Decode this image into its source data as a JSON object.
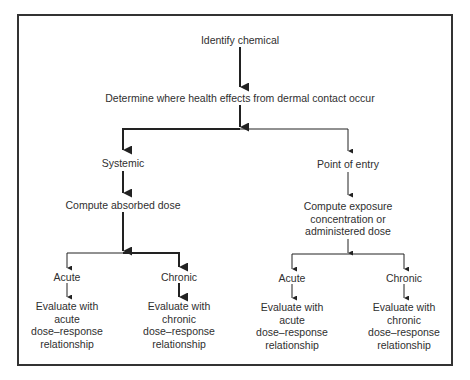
{
  "diagram": {
    "type": "flowchart",
    "nodes": {
      "identify": "Identify chemical",
      "determine": "Determine where health effects from dermal contact occur",
      "systemic": "Systemic",
      "absorbed": "Compute absorbed dose",
      "point_of_entry": "Point of entry",
      "exposure": [
        "Compute exposure",
        "concentration or",
        "administered dose"
      ],
      "left_acute": "Acute",
      "left_chronic": "Chronic",
      "left_acute_eval": [
        "Evaluate with",
        "acute",
        "dose–response",
        "relationship"
      ],
      "left_chronic_eval": [
        "Evaluate with",
        "chronic",
        "dose–response",
        "relationship"
      ],
      "right_acute": "Acute",
      "right_chronic": "Chronic",
      "right_acute_eval": [
        "Evaluate with",
        "acute",
        "dose–response",
        "relationship"
      ],
      "right_chronic_eval": [
        "Evaluate with",
        "chronic",
        "dose–response",
        "relationship"
      ]
    },
    "edges": [
      {
        "from": "identify",
        "to": "determine",
        "emphasis": "bold"
      },
      {
        "from": "determine",
        "to": "systemic",
        "emphasis": "bold"
      },
      {
        "from": "determine",
        "to": "point_of_entry",
        "emphasis": "thin"
      },
      {
        "from": "systemic",
        "to": "absorbed",
        "emphasis": "bold"
      },
      {
        "from": "absorbed",
        "to": "left_acute",
        "emphasis": "thin"
      },
      {
        "from": "absorbed",
        "to": "left_chronic",
        "emphasis": "bold"
      },
      {
        "from": "left_acute",
        "to": "left_acute_eval",
        "emphasis": "thin"
      },
      {
        "from": "left_chronic",
        "to": "left_chronic_eval",
        "emphasis": "bold"
      },
      {
        "from": "point_of_entry",
        "to": "exposure",
        "emphasis": "thin"
      },
      {
        "from": "exposure",
        "to": "right_acute",
        "emphasis": "thin"
      },
      {
        "from": "exposure",
        "to": "right_chronic",
        "emphasis": "thin"
      },
      {
        "from": "right_acute",
        "to": "right_acute_eval",
        "emphasis": "thin"
      },
      {
        "from": "right_chronic",
        "to": "right_chronic_eval",
        "emphasis": "thin"
      }
    ],
    "colors": {
      "line": "#222222",
      "text": "#2f2f2f",
      "frame": "#333333"
    }
  }
}
